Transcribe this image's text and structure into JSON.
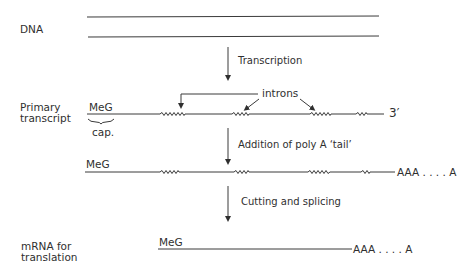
{
  "rows": {
    "dna": {
      "label": "DNA"
    },
    "primary": {
      "label_line1": "Primary",
      "label_line2": "transcript",
      "cap_text": "MeG",
      "cap_label": "cap.",
      "end_label": "3′"
    },
    "polyA": {
      "cap_text": "MeG",
      "tail_label": "AAA . . . . A"
    },
    "mrna": {
      "label_line1": "mRNA  for",
      "label_line2": "translation",
      "cap_text": "MeG",
      "tail_label": "AAA . . . . A"
    }
  },
  "steps": [
    {
      "label": "Transcription"
    },
    {
      "label": "Addition of poly A ‘tail’"
    },
    {
      "label": "Cutting and splicing"
    }
  ],
  "annotations": {
    "introns": "introns"
  },
  "colors": {
    "ink": "#2f2f2f",
    "background": "#ffffff"
  }
}
